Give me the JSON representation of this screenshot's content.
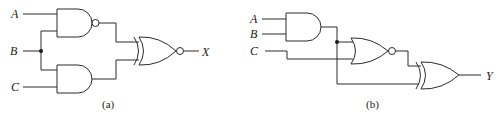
{
  "diagram_a": {
    "caption": "(a)",
    "inputs": [
      "A",
      "B",
      "C"
    ],
    "output": "X",
    "gates": [
      {
        "id": "g1",
        "type": "NAND",
        "inputs": [
          "A",
          "B"
        ]
      },
      {
        "id": "g2",
        "type": "AND",
        "inputs": [
          "B",
          "C"
        ]
      },
      {
        "id": "g3",
        "type": "XNOR",
        "inputs": [
          "g1",
          "g2"
        ],
        "output": "X"
      }
    ]
  },
  "diagram_b": {
    "caption": "(b)",
    "inputs": [
      "A",
      "B",
      "C"
    ],
    "output": "Y",
    "gates": [
      {
        "id": "g1",
        "type": "AND",
        "inputs": [
          "A",
          "B"
        ]
      },
      {
        "id": "g2",
        "type": "NOR",
        "inputs": [
          "g1",
          "C"
        ]
      },
      {
        "id": "g3",
        "type": "XOR",
        "inputs": [
          "g2",
          "g1"
        ],
        "output": "Y"
      }
    ]
  },
  "style": {
    "wire_color": "#2a2a2a",
    "background": "#ffffff"
  }
}
